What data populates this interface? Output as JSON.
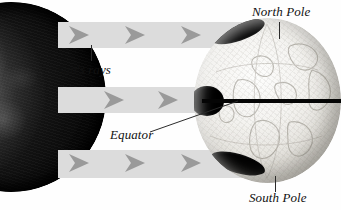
{
  "figure": {
    "background_color": "#fefefe",
    "width": 341,
    "height": 210
  },
  "labels": {
    "north_pole": "North Pole",
    "south_pole": "South Pole",
    "suns_rays": "Sun's rays",
    "equator": "Equator",
    "top_clipped_caption": ""
  },
  "colors": {
    "ray_band": "#dcdcdc",
    "chevron": "#9a9a9a",
    "equator_line": "#050505",
    "leader_line": "#2b2b2b",
    "label_text": "#111111",
    "sun_dark": "#0a0a0a",
    "globe_light": "#f4f3f0",
    "polar_shadow": "#0d0d0d"
  },
  "objects": {
    "sun": {
      "name": "Sun",
      "description": "large dark textured sphere, cropped at the left edge"
    },
    "earth": {
      "name": "Earth",
      "description": "light gray globe with faint continents, dark shadow at both poles and western equator"
    }
  },
  "rays": [
    {
      "id": "ray-top",
      "chevron_count": 3
    },
    {
      "id": "ray-middle",
      "chevron_count": 2
    },
    {
      "id": "ray-bottom",
      "chevron_count": 3
    }
  ],
  "chevrons": [
    {
      "ray": "ray-top",
      "x": 68,
      "y": 25
    },
    {
      "ray": "ray-top",
      "x": 124,
      "y": 25
    },
    {
      "ray": "ray-top",
      "x": 180,
      "y": 25
    },
    {
      "ray": "ray-middle",
      "x": 103,
      "y": 90
    },
    {
      "ray": "ray-middle",
      "x": 157,
      "y": 90
    },
    {
      "ray": "ray-bottom",
      "x": 68,
      "y": 153
    },
    {
      "ray": "ray-bottom",
      "x": 124,
      "y": 153
    },
    {
      "ray": "ray-bottom",
      "x": 180,
      "y": 153
    }
  ]
}
